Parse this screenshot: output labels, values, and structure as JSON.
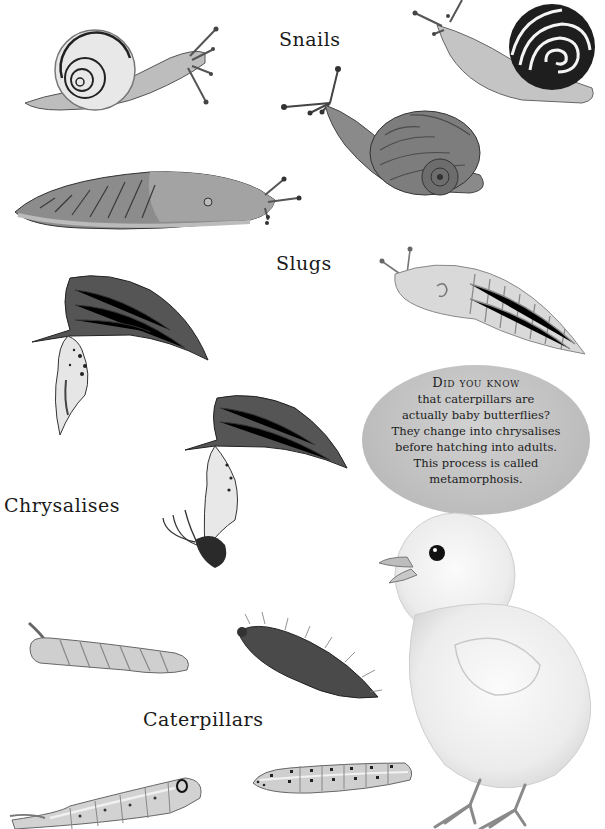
{
  "labels": {
    "snails": "Snails",
    "slugs": "Slugs",
    "chrysalises": "Chrysalises",
    "caterpillars": "Caterpillars"
  },
  "fact_bubble": {
    "title": "Did you know",
    "lines": [
      "that caterpillars are",
      "actually baby butterflies?",
      "They change into chrysalises",
      "before hatching into adults.",
      "This process is called",
      "metamorphosis."
    ]
  },
  "illustrations": [
    {
      "name": "white-lipped-snail",
      "group": "snails"
    },
    {
      "name": "banded-snail",
      "group": "snails"
    },
    {
      "name": "garden-snail",
      "group": "snails"
    },
    {
      "name": "leopard-slug",
      "group": "slugs"
    },
    {
      "name": "pale-slug",
      "group": "slugs"
    },
    {
      "name": "chrysalis-on-leaf",
      "group": "chrysalises"
    },
    {
      "name": "hatching-chrysalis-on-leaf",
      "group": "chrysalises"
    },
    {
      "name": "horned-caterpillar",
      "group": "caterpillars"
    },
    {
      "name": "hairy-caterpillar",
      "group": "caterpillars"
    },
    {
      "name": "hawkmoth-caterpillar",
      "group": "caterpillars"
    },
    {
      "name": "spotted-caterpillar",
      "group": "caterpillars"
    },
    {
      "name": "baby-chick",
      "group": "other"
    }
  ],
  "colors": {
    "background": "#ffffff",
    "bubble": "#c4c4c4",
    "ink": "#1a1a1a"
  }
}
